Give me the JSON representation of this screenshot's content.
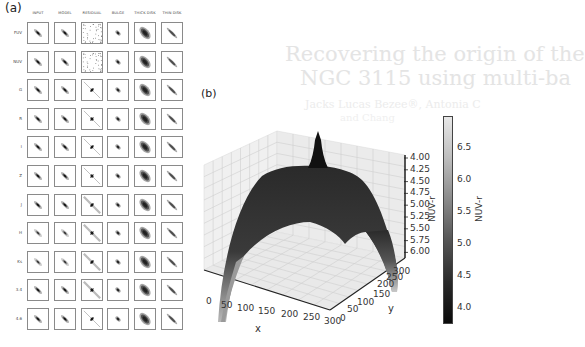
{
  "background_text": {
    "title_line1": "Recovering the origin of the",
    "title_line2": "NGC 3115 using multi-ba",
    "authors_line1": "Jacks Lucas Bezee®, Antonia C",
    "authors_line2": "and Chang"
  },
  "panel_a": {
    "label": "(a)",
    "columns": [
      "INPUT",
      "MODEL",
      "RESIDUAL",
      "BULGE",
      "THICK DISK",
      "THIN DISK"
    ],
    "rows": [
      "FUV",
      "NUV",
      "G",
      "R",
      "I",
      "Z",
      "J",
      "H",
      "Ks",
      "3.4",
      "4.6"
    ]
  },
  "panel_b": {
    "label": "(b)",
    "xlabel": "x",
    "ylabel": "y",
    "zlabel": "NUV-r",
    "x_ticks": [
      "0",
      "50",
      "100",
      "150",
      "200",
      "250",
      "300"
    ],
    "y_ticks": [
      "0",
      "50",
      "100",
      "150",
      "200",
      "250",
      "300"
    ],
    "z_ticks": [
      "4.00",
      "4.25",
      "4.50",
      "4.75",
      "5.00",
      "5.25",
      "5.50",
      "5.75",
      "6.00"
    ],
    "colorbar": {
      "label": "NUV-r",
      "ticks": [
        "6.5",
        "6.0",
        "5.5",
        "5.0",
        "4.5",
        "4.0"
      ]
    }
  },
  "chart_data": [
    {
      "type": "table",
      "title": "(a) Multi-band decomposition panels",
      "columns": [
        "INPUT",
        "MODEL",
        "RESIDUAL",
        "BULGE",
        "THICK DISK",
        "THIN DISK"
      ],
      "rows": [
        "FUV",
        "NUV",
        "G",
        "R",
        "I",
        "Z",
        "J",
        "H",
        "Ks",
        "3.4",
        "4.6"
      ]
    },
    {
      "type": "surface3d",
      "title": "(b)",
      "xlabel": "x",
      "ylabel": "y",
      "zlabel": "NUV-r",
      "xlim": [
        0,
        300
      ],
      "ylim": [
        0,
        300
      ],
      "zlim": [
        6.0,
        4.0
      ],
      "z_inverted": true,
      "colorbar": {
        "label": "NUV-r",
        "range": [
          3.8,
          6.9
        ],
        "ticks": [
          4.0,
          4.5,
          5.0,
          5.5,
          6.0,
          6.5
        ],
        "cmap": "gray"
      },
      "description": "Dome-shaped NUV-r color surface, minimum (~3.9) peak spike at center (~150,150), rising toward ~6+ at edges"
    }
  ]
}
